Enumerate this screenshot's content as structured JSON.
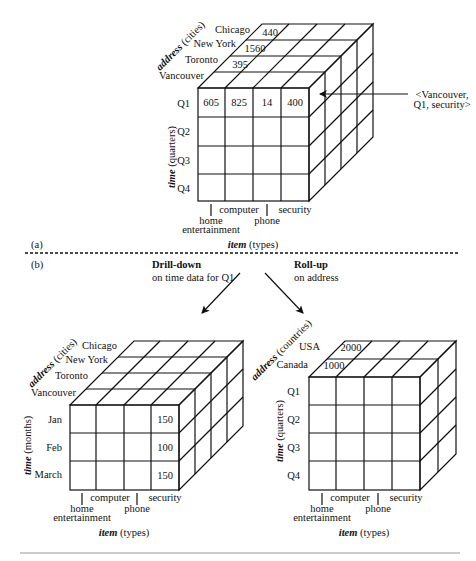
{
  "panel_a": {
    "label": "(a)",
    "address_axis": {
      "name": "address",
      "unit": " (cities)"
    },
    "time_axis": {
      "name": "time",
      "unit": " (quarters)"
    },
    "item_axis": {
      "name": "item",
      "unit": " (types)"
    },
    "cities": [
      "Chicago",
      "New York",
      "Toronto",
      "Vancouver"
    ],
    "quarters": [
      "Q1",
      "Q2",
      "Q3",
      "Q4"
    ],
    "items": [
      "home entertainment",
      "computer",
      "phone",
      "security"
    ],
    "item_labels": {
      "home_1": "home",
      "home_2": "entertainment",
      "computer": "computer",
      "phone": "phone",
      "security": "security"
    },
    "front_q1_values": [
      "605",
      "825",
      "14",
      "400"
    ],
    "top_values": {
      "chicago": "440",
      "new_york": "1560",
      "toronto": "395"
    },
    "annotation_line1": "<Vancouver,",
    "annotation_line2": "Q1, security>"
  },
  "panel_b": {
    "label": "(b)",
    "drilldown": {
      "title": "Drill-down",
      "subtitle": "on time data for Q1"
    },
    "rollup": {
      "title": "Roll-up",
      "subtitle": "on address"
    }
  },
  "drilldown_cube": {
    "address_axis": {
      "name": "address",
      "unit": " (cities)"
    },
    "time_axis": {
      "name": "time",
      "unit": " (months)"
    },
    "item_axis": {
      "name": "item",
      "unit": " (types)"
    },
    "cities": [
      "Chicago",
      "New York",
      "Toronto",
      "Vancouver"
    ],
    "months": [
      "Jan",
      "Feb",
      "March"
    ],
    "item_labels": {
      "home_1": "home",
      "home_2": "entertainment",
      "computer": "computer",
      "phone": "phone",
      "security": "security"
    },
    "security_values": [
      "150",
      "100",
      "150"
    ]
  },
  "rollup_cube": {
    "address_axis": {
      "name": "address",
      "unit": " (countries)"
    },
    "time_axis": {
      "name": "time",
      "unit": " (quarters)"
    },
    "item_axis": {
      "name": "item",
      "unit": " (types)"
    },
    "countries": [
      "USA",
      "Canada"
    ],
    "quarters": [
      "Q1",
      "Q2",
      "Q3",
      "Q4"
    ],
    "item_labels": {
      "home_1": "home",
      "home_2": "entertainment",
      "computer": "computer",
      "phone": "phone",
      "security": "security"
    },
    "top_values": {
      "usa": "2000",
      "canada": "1000"
    }
  }
}
